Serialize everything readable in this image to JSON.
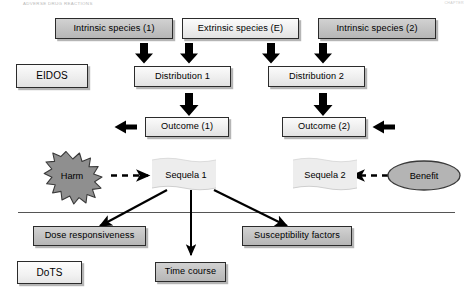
{
  "page": {
    "width": 473,
    "height": 297,
    "background": "#ffffff",
    "header_left": "ADVERSE DRUG REACTIONS",
    "header_right": "CHAPTER"
  },
  "colors": {
    "box_gray_fill": "#c6c6c6",
    "box_light_fill": "#eeeeee",
    "border": "#2b2b2b",
    "shadow": "#9a9a9a",
    "harm_fill": "#8f8f8f",
    "benefit_fill": "#b4b4b4",
    "sequela_fill": "#ededed",
    "arrow": "#000000",
    "divider": "#555555"
  },
  "eidos": {
    "section_label": "EIDOS",
    "species": [
      {
        "id": "intrinsic-1",
        "label": "Intrinsic species (1)",
        "style": "gray"
      },
      {
        "id": "extrinsic-e",
        "label": "Extrinsic species (E)",
        "style": "light"
      },
      {
        "id": "intrinsic-2",
        "label": "Intrinsic species (2)",
        "style": "gray"
      }
    ],
    "distributions": [
      {
        "id": "distribution-1",
        "label": "Distribution 1",
        "style": "light"
      },
      {
        "id": "distribution-2",
        "label": "Distribution 2",
        "style": "light"
      }
    ],
    "outcomes": [
      {
        "id": "outcome-1",
        "label": "Outcome (1)",
        "style": "light"
      },
      {
        "id": "outcome-2",
        "label": "Outcome (2)",
        "style": "light"
      }
    ]
  },
  "middle": {
    "harm_label": "Harm",
    "benefit_label": "Benefit",
    "sequela_1_label": "Sequela 1",
    "sequela_2_label": "Sequela 2"
  },
  "dots": {
    "section_label": "DoTS",
    "items": [
      {
        "id": "dose-responsiveness",
        "label": "Dose responsiveness",
        "style": "gray"
      },
      {
        "id": "time-course",
        "label": "Time course",
        "style": "gray"
      },
      {
        "id": "susceptibility-factors",
        "label": "Susceptibility factors",
        "style": "gray"
      }
    ]
  },
  "diagram_data": {
    "type": "flowchart",
    "title": "EIDOS and DoTS pharmacovigilance model",
    "sections": [
      "EIDOS",
      "DoTS"
    ],
    "nodes": [
      "Intrinsic species (1)",
      "Extrinsic species (E)",
      "Intrinsic species (2)",
      "Distribution 1",
      "Distribution 2",
      "Outcome (1)",
      "Outcome (2)",
      "Harm",
      "Sequela 1",
      "Sequela 2",
      "Benefit",
      "Dose responsiveness",
      "Time course",
      "Susceptibility factors"
    ],
    "edges": [
      {
        "from": "Intrinsic species (1)",
        "to": "Distribution 1",
        "style": "solid-block"
      },
      {
        "from": "Extrinsic species (E)",
        "to": "Distribution 1",
        "style": "solid-block"
      },
      {
        "from": "Extrinsic species (E)",
        "to": "Distribution 2",
        "style": "solid-block"
      },
      {
        "from": "Intrinsic species (2)",
        "to": "Distribution 2",
        "style": "solid-block"
      },
      {
        "from": "Distribution 1",
        "to": "Outcome (1)",
        "style": "solid-block"
      },
      {
        "from": "Distribution 2",
        "to": "Outcome (2)",
        "style": "solid-block"
      },
      {
        "from": "Outcome (1)",
        "to": "left",
        "style": "solid-block-left"
      },
      {
        "from": "Outcome (2)",
        "to": "right-in",
        "style": "solid-block-left"
      },
      {
        "from": "Harm",
        "to": "Sequela 1",
        "style": "dashed"
      },
      {
        "from": "Benefit",
        "to": "Sequela 2",
        "style": "dashed"
      },
      {
        "from": "Sequela 1",
        "to": "Dose responsiveness",
        "style": "thin-arrow"
      },
      {
        "from": "Sequela 1",
        "to": "Time course",
        "style": "thin-arrow"
      },
      {
        "from": "Sequela 1",
        "to": "Susceptibility factors",
        "style": "thin-arrow"
      }
    ]
  }
}
